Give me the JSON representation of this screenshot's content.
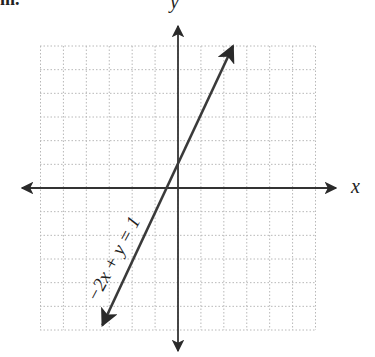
{
  "header_fragment": "m.",
  "graph": {
    "x_axis_label": "x",
    "y_axis_label": "y",
    "line_label": "−2x + y = 1",
    "equation": {
      "a": -2,
      "b": 1,
      "c": 1
    },
    "grid": {
      "x_min": -6,
      "x_max": 6,
      "y_min": -6,
      "y_max": 6,
      "step": 1,
      "style": "dotted"
    },
    "line_endpoints": [
      {
        "x": -3.3,
        "y": -5.8
      },
      {
        "x": 2.4,
        "y": 6.0
      }
    ],
    "colors": {
      "grid": "#b8b8b8",
      "axis": "#333333",
      "line": "#3a3a3a",
      "text": "#222222"
    }
  }
}
